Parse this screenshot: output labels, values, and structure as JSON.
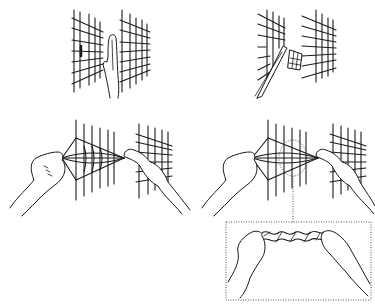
{
  "figure": {
    "panels": [
      {
        "id": "a",
        "description": "hand inserted vertically between two grid sheets"
      },
      {
        "id": "b",
        "description": "tool cutting and folding a grid section between two sheets"
      },
      {
        "id": "c",
        "description": "two hands pulling grid mesh apart from both sides"
      },
      {
        "id": "d",
        "description": "two hands pulling grid mesh with dotted callout region"
      }
    ],
    "callout": {
      "description": "detail box showing two hands twisting crumpled mesh strip",
      "border_style": "dotted"
    },
    "colors": {
      "line": "#1a1a1a",
      "background": "#ffffff",
      "callout_border": "#444444"
    }
  }
}
